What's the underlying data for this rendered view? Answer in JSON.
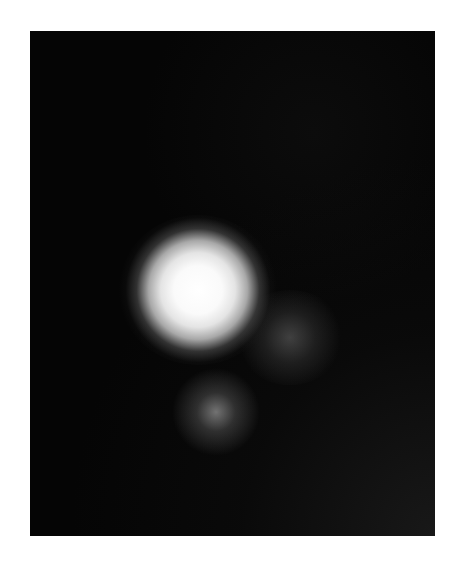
{
  "image": {
    "description": "Grayscale image of three diffuse glowing blobs on a dark background",
    "background_color": "#050505",
    "blobs": [
      {
        "name": "primary-bright-blob",
        "cx": 168,
        "cy": 259,
        "radius": 75,
        "color": "#ffffff"
      },
      {
        "name": "secondary-faint-blob",
        "cx": 260,
        "cy": 304,
        "radius": 45,
        "color": "#6a6a6a"
      },
      {
        "name": "tertiary-dim-blob",
        "cx": 185,
        "cy": 381,
        "radius": 38,
        "color": "#8a8a8a"
      }
    ]
  }
}
